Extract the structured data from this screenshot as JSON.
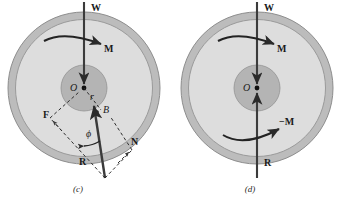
{
  "figure": {
    "type": "free-body-diagram",
    "background": "#ffffff",
    "colors": {
      "outer_ring": "#b9b9b9",
      "disc_fill": "#dcdcdc",
      "hub_fill": "#b3b3b3",
      "stroke": "#6e6e6e",
      "ink": "#1a1a1a"
    },
    "panels": [
      {
        "id": "c",
        "caption": "(c)",
        "geometry": {
          "center_x": 84,
          "center_y": 88,
          "outer_radius": 76,
          "disc_radius": 69,
          "hub_radius": 23
        },
        "labels": {
          "W": "W",
          "M": "M",
          "O": "O",
          "r": "r",
          "B": "B",
          "F": "F",
          "N": "N",
          "R": "R",
          "phi": "ϕ"
        },
        "forces": [
          {
            "name": "W",
            "label": "W",
            "direction": "down",
            "description": "weight acting downward through center"
          },
          {
            "name": "R",
            "label": "R",
            "direction": "up",
            "description": "resultant reaction inclined through contact point B"
          },
          {
            "name": "M",
            "label": "M",
            "direction": "clockwise",
            "description": "applied couple"
          },
          {
            "name": "F",
            "label": "F",
            "direction": "horizontal",
            "description": "friction component of R"
          },
          {
            "name": "N",
            "label": "N",
            "direction": "normal",
            "description": "normal component of R"
          },
          {
            "name": "B",
            "label": "B",
            "description": "contact point on hub circle"
          },
          {
            "name": "phi",
            "label": "ϕ",
            "description": "angle of R from vertical"
          }
        ]
      },
      {
        "id": "d",
        "caption": "(d)",
        "geometry": {
          "center_x": 257,
          "center_y": 88,
          "outer_radius": 76,
          "disc_radius": 69,
          "hub_radius": 23
        },
        "labels": {
          "W": "W",
          "M_top": "M",
          "M_bottom": "−M",
          "O": "O",
          "R": "R"
        },
        "forces": [
          {
            "name": "W",
            "label": "W",
            "direction": "down",
            "description": "weight acting downward through center"
          },
          {
            "name": "R",
            "label": "R",
            "direction": "up",
            "description": "reaction acting upward through center"
          },
          {
            "name": "M_top",
            "label": "M",
            "direction": "clockwise",
            "description": "applied couple"
          },
          {
            "name": "M_bottom",
            "label": "−M",
            "direction": "counterclockwise",
            "description": "equal and opposite couple"
          }
        ]
      }
    ]
  }
}
